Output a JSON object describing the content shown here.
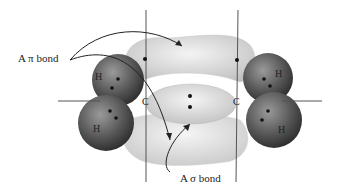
{
  "diagram": {
    "labels": {
      "pi_bond": "A π bond",
      "sigma_bond": "A σ bond"
    },
    "atoms": {
      "h_top_left": "H",
      "h_bottom_left": "H",
      "h_top_right": "H",
      "h_bottom_right": "H",
      "c_left": "C",
      "c_right": "C"
    },
    "colors": {
      "lobe": "#d9d9d9",
      "hydrogen": "#555555",
      "axis": "#555555"
    }
  }
}
